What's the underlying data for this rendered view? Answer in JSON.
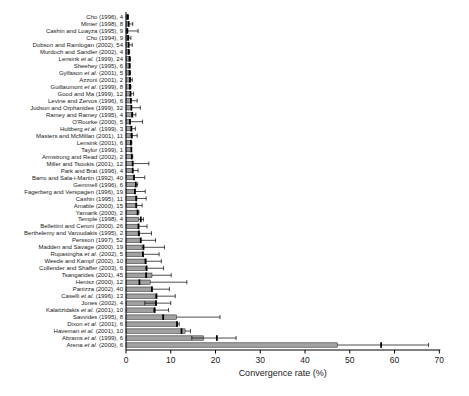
{
  "chart_data": {
    "type": "bar",
    "orientation": "horizontal",
    "title": "",
    "xlabel": "Convergence rate (%)",
    "ylabel": "",
    "xlim": [
      0,
      70
    ],
    "xticks": [
      0,
      10,
      20,
      30,
      40,
      50,
      60,
      70
    ],
    "grid": false,
    "legend": "none",
    "bar_color": "#a1a1a1",
    "bar_edge_color": "#1a1a1a",
    "error_color": "#000000",
    "marker_color": "#000000",
    "background": "#ffffff",
    "value_unit": "percent",
    "studies": [
      {
        "label": "Cho (1996), 4",
        "value": 0.2,
        "marker": 0.4,
        "lo": null,
        "hi": 0.5
      },
      {
        "label": "Minier (1998), 8",
        "value": 0.5,
        "marker": 0.6,
        "lo": null,
        "hi": 1.5
      },
      {
        "label": "Cashin and Loayza (1995), 9",
        "value": 0.2,
        "marker": 0.3,
        "lo": null,
        "hi": 2.7
      },
      {
        "label": "Cho (1994), 9",
        "value": 0.4,
        "marker": 0.5,
        "lo": null,
        "hi": 1.1
      },
      {
        "label": "Dobson and Ramlogan (2002), 54",
        "value": 0.5,
        "marker": 0.6,
        "lo": null,
        "hi": 1.4
      },
      {
        "label": "Murdoch and Sandler (2002), 4",
        "value": 0.6,
        "marker": 0.6,
        "lo": null,
        "hi": 0.8
      },
      {
        "label": "Lensink et al. (1999), 24",
        "value": 0.7,
        "marker": 0.8,
        "lo": null,
        "hi": 1.0
      },
      {
        "label": "Sheehey (1995), 6",
        "value": 0.7,
        "marker": 0.8,
        "lo": null,
        "hi": 0.9
      },
      {
        "label": "Gylfason et al. (2001), 5",
        "value": 0.8,
        "marker": 0.8,
        "lo": null,
        "hi": 1.0
      },
      {
        "label": "Azzoni (2001), 2",
        "value": 0.8,
        "marker": 0.9,
        "lo": null,
        "hi": 1.4
      },
      {
        "label": "Guillaumont et al. (1999), 8",
        "value": 0.9,
        "marker": 0.9,
        "lo": null,
        "hi": 1.1
      },
      {
        "label": "Good and Ma (1999), 12",
        "value": 1.0,
        "marker": 1.0,
        "lo": null,
        "hi": 1.7
      },
      {
        "label": "Levine and Zervos (1996), 6",
        "value": 1.0,
        "marker": 1.1,
        "lo": null,
        "hi": 2.5
      },
      {
        "label": "Judson and Orphanides (1999), 32",
        "value": 1.2,
        "marker": 1.2,
        "lo": null,
        "hi": 3.2
      },
      {
        "label": "Ramey and Ramey (1995), 4",
        "value": 1.3,
        "marker": 1.4,
        "lo": null,
        "hi": 2.2
      },
      {
        "label": "O'Rourke (2000), 5",
        "value": 0.8,
        "marker": 0.9,
        "lo": null,
        "hi": 3.7
      },
      {
        "label": "Hultberg et al. (1999), 3",
        "value": 1.2,
        "marker": 1.2,
        "lo": null,
        "hi": 2.1
      },
      {
        "label": "Masters and McMillan (2001), 11",
        "value": 1.0,
        "marker": 1.3,
        "lo": null,
        "hi": 2.5
      },
      {
        "label": "Lensink (2001), 6",
        "value": 1.0,
        "marker": 1.1,
        "lo": null,
        "hi": 1.3
      },
      {
        "label": "Taylor (1999), 1",
        "value": 1.2,
        "marker": 1.2,
        "lo": null,
        "hi": null
      },
      {
        "label": "Armstrong and Read (2002), 2",
        "value": 1.2,
        "marker": 1.3,
        "lo": null,
        "hi": 1.5
      },
      {
        "label": "Miller and Tsoukis (2001), 12",
        "value": 1.4,
        "marker": 1.5,
        "lo": null,
        "hi": 5.1
      },
      {
        "label": "Park and Brat (1996), 4",
        "value": 1.4,
        "marker": 1.5,
        "lo": null,
        "hi": 2.7
      },
      {
        "label": "Barro and Sala-i-Martin (1992), 40",
        "value": 1.7,
        "marker": 1.8,
        "lo": null,
        "hi": 4.2
      },
      {
        "label": "Gemmell (1996), 6",
        "value": 2.1,
        "marker": 2.2,
        "lo": null,
        "hi": 2.6
      },
      {
        "label": "Fagerberg and Verspagen (1996), 19",
        "value": 1.9,
        "marker": 2.0,
        "lo": null,
        "hi": 4.3
      },
      {
        "label": "Cashin (1995), 11",
        "value": 2.2,
        "marker": 2.3,
        "lo": null,
        "hi": 4.5
      },
      {
        "label": "Amable (2000), 15",
        "value": 2.2,
        "marker": 2.3,
        "lo": null,
        "hi": 3.6
      },
      {
        "label": "Yamarik (2000), 2",
        "value": 2.5,
        "marker": 2.6,
        "lo": null,
        "hi": 2.9
      },
      {
        "label": "Temple (1998), 4",
        "value": 2.8,
        "marker": 3.3,
        "lo": null,
        "hi": 3.9
      },
      {
        "label": "Bellettini and Ceroni (2000), 26",
        "value": 2.7,
        "marker": 2.8,
        "lo": null,
        "hi": 4.7
      },
      {
        "label": "Berthelemy and Varoudakis (1995), 2",
        "value": 2.7,
        "marker": 2.9,
        "lo": null,
        "hi": 5.7
      },
      {
        "label": "Persson (1997), 52",
        "value": 3.2,
        "marker": 3.3,
        "lo": null,
        "hi": 6.6
      },
      {
        "label": "Madden and Savage (2000), 19",
        "value": 3.6,
        "marker": 3.9,
        "lo": null,
        "hi": 8.6
      },
      {
        "label": "Rupasingha et al. (2002), 5",
        "value": 3.7,
        "marker": 3.8,
        "lo": null,
        "hi": 7.4
      },
      {
        "label": "Weede and Kampf (2002), 10",
        "value": 4.2,
        "marker": 4.4,
        "lo": null,
        "hi": 7.9
      },
      {
        "label": "Collender and Shaffer (2003), 6",
        "value": 4.3,
        "marker": 4.6,
        "lo": null,
        "hi": 8.4
      },
      {
        "label": "Tsangarides (2001), 45",
        "value": 5.8,
        "marker": 4.5,
        "lo": null,
        "hi": 10.1
      },
      {
        "label": "Henisz (2000), 12",
        "value": 5.4,
        "marker": 3.0,
        "lo": null,
        "hi": 13.6
      },
      {
        "label": "Panizza (2002), 40",
        "value": 5.7,
        "marker": 5.8,
        "lo": null,
        "hi": 9.7
      },
      {
        "label": "Caselli et al. (1996), 13",
        "value": 6.6,
        "marker": 6.8,
        "lo": null,
        "hi": 11.0
      },
      {
        "label": "Jones (2002), 4",
        "value": 6.6,
        "marker": 6.7,
        "lo": 4.2,
        "hi": 10.0
      },
      {
        "label": "Kalaitzidakis et al. (2001), 10",
        "value": 6.2,
        "marker": 6.4,
        "lo": null,
        "hi": 9.5
      },
      {
        "label": "Savvides (1995), 8",
        "value": 11.3,
        "marker": 8.3,
        "lo": null,
        "hi": 21.0
      },
      {
        "label": "Dixon et al. (2001), 6",
        "value": 11.5,
        "marker": 11.4,
        "lo": null,
        "hi": 11.9
      },
      {
        "label": "Haveman et al. (2001), 10",
        "value": 13.2,
        "marker": 12.4,
        "lo": null,
        "hi": 14.4
      },
      {
        "label": "Abrams et al. (1999), 6",
        "value": 17.3,
        "marker": 20.3,
        "lo": 14.7,
        "hi": 24.6
      },
      {
        "label": "Arena et al. (2000), 6",
        "value": 47.2,
        "marker": 57.0,
        "lo": null,
        "hi": 67.6
      }
    ]
  }
}
